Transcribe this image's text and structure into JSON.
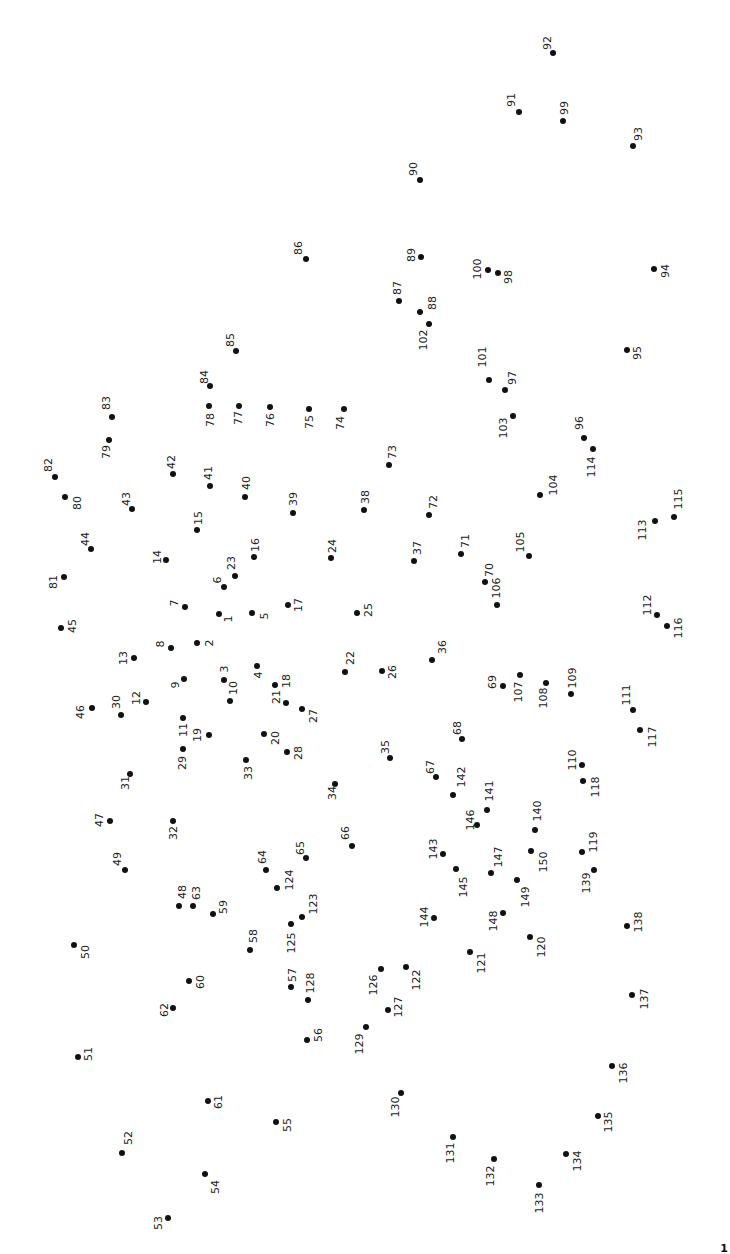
{
  "puzzle": {
    "type": "connect-the-dots",
    "label_rotation_deg": -90,
    "dot_color": "#111111",
    "label_color": "#222222",
    "background": "#ffffff",
    "dot_count": 150,
    "dots": [
      [
        1,
        219,
        614,
        9,
        5
      ],
      [
        2,
        197,
        643,
        12,
        0
      ],
      [
        3,
        224,
        680,
        0,
        -11
      ],
      [
        4,
        257,
        666,
        1,
        9
      ],
      [
        5,
        252,
        613,
        12,
        3
      ],
      [
        6,
        224,
        587,
        -7,
        -7
      ],
      [
        7,
        185,
        607,
        -11,
        -4
      ],
      [
        8,
        171,
        648,
        -11,
        -4
      ],
      [
        9,
        184,
        679,
        -9,
        6
      ],
      [
        10,
        230,
        701,
        3,
        -13
      ],
      [
        11,
        183,
        718,
        0,
        12
      ],
      [
        12,
        146,
        702,
        -10,
        -4
      ],
      [
        13,
        134,
        658,
        -11,
        0
      ],
      [
        14,
        166,
        560,
        -9,
        -3
      ],
      [
        15,
        197,
        530,
        1,
        -12
      ],
      [
        16,
        254,
        557,
        1,
        -12
      ],
      [
        17,
        288,
        605,
        10,
        0
      ],
      [
        18,
        275,
        685,
        11,
        -4
      ],
      [
        19,
        209,
        735,
        -12,
        0
      ],
      [
        20,
        264,
        734,
        11,
        4
      ],
      [
        21,
        286,
        703,
        -10,
        -6
      ],
      [
        22,
        345,
        672,
        5,
        -14
      ],
      [
        23,
        235,
        576,
        -4,
        -13
      ],
      [
        24,
        331,
        558,
        1,
        -12
      ],
      [
        25,
        357,
        613,
        11,
        -3
      ],
      [
        26,
        382,
        671,
        10,
        1
      ],
      [
        27,
        302,
        709,
        11,
        7
      ],
      [
        28,
        287,
        752,
        11,
        1
      ],
      [
        29,
        183,
        749,
        -1,
        14
      ],
      [
        30,
        121,
        715,
        -5,
        -13
      ],
      [
        31,
        130,
        774,
        -5,
        9
      ],
      [
        32,
        173,
        821,
        0,
        12
      ],
      [
        33,
        246,
        760,
        2,
        13
      ],
      [
        34,
        335,
        784,
        -3,
        9
      ],
      [
        35,
        390,
        758,
        -5,
        -11
      ],
      [
        36,
        432,
        660,
        10,
        -13
      ],
      [
        37,
        414,
        561,
        3,
        -13
      ],
      [
        38,
        364,
        510,
        1,
        -13
      ],
      [
        39,
        293,
        513,
        0,
        -14
      ],
      [
        40,
        245,
        497,
        1,
        -14
      ],
      [
        41,
        210,
        486,
        -2,
        -13
      ],
      [
        42,
        173,
        474,
        -2,
        -12
      ],
      [
        43,
        132,
        509,
        -6,
        -10
      ],
      [
        44,
        91,
        549,
        -6,
        -10
      ],
      [
        45,
        61,
        628,
        11,
        -2
      ],
      [
        46,
        92,
        708,
        -12,
        4
      ],
      [
        47,
        110,
        821,
        -11,
        -1
      ],
      [
        48,
        179,
        906,
        3,
        -14
      ],
      [
        49,
        125,
        870,
        -8,
        -11
      ],
      [
        50,
        74,
        945,
        11,
        7
      ],
      [
        51,
        78,
        1057,
        10,
        -3
      ],
      [
        52,
        122,
        1153,
        6,
        -15
      ],
      [
        53,
        168,
        1218,
        -10,
        5
      ],
      [
        54,
        205,
        1174,
        10,
        13
      ],
      [
        55,
        276,
        1122,
        11,
        3
      ],
      [
        56,
        307,
        1040,
        11,
        -5
      ],
      [
        57,
        291,
        987,
        1,
        -12
      ],
      [
        58,
        250,
        950,
        3,
        -14
      ],
      [
        59,
        213,
        914,
        10,
        -7
      ],
      [
        60,
        189,
        981,
        11,
        1
      ],
      [
        61,
        208,
        1101,
        10,
        1
      ],
      [
        62,
        173,
        1008,
        -9,
        2
      ],
      [
        63,
        193,
        906,
        3,
        -13
      ],
      [
        64,
        266,
        870,
        -4,
        -13
      ],
      [
        65,
        306,
        858,
        -6,
        -10
      ],
      [
        66,
        352,
        846,
        -7,
        -13
      ],
      [
        67,
        436,
        777,
        -6,
        -10
      ],
      [
        68,
        462,
        739,
        -5,
        -11
      ],
      [
        69,
        503,
        686,
        -11,
        -4
      ],
      [
        70,
        485,
        582,
        4,
        -12
      ],
      [
        71,
        461,
        554,
        4,
        -13
      ],
      [
        72,
        429,
        515,
        4,
        -13
      ],
      [
        73,
        389,
        465,
        3,
        -13
      ],
      [
        74,
        344,
        409,
        -4,
        14
      ],
      [
        75,
        309,
        409,
        0,
        13
      ],
      [
        76,
        270,
        407,
        0,
        13
      ],
      [
        77,
        239,
        406,
        -1,
        12
      ],
      [
        78,
        209,
        406,
        1,
        14
      ],
      [
        79,
        109,
        440,
        -3,
        12
      ],
      [
        80,
        65,
        497,
        12,
        6
      ],
      [
        81,
        64,
        577,
        -11,
        5
      ],
      [
        82,
        55,
        477,
        -7,
        -12
      ],
      [
        83,
        112,
        417,
        -6,
        -14
      ],
      [
        84,
        210,
        386,
        -6,
        -9
      ],
      [
        85,
        236,
        351,
        -6,
        -11
      ],
      [
        86,
        306,
        259,
        -8,
        -11
      ],
      [
        87,
        399,
        301,
        -2,
        -13
      ],
      [
        88,
        420,
        312,
        12,
        -9
      ],
      [
        89,
        421,
        257,
        -10,
        -2
      ],
      [
        90,
        420,
        180,
        -7,
        -11
      ],
      [
        91,
        519,
        112,
        -8,
        -12
      ],
      [
        92,
        553,
        53,
        -6,
        -10
      ],
      [
        93,
        633,
        146,
        5,
        -12
      ],
      [
        94,
        654,
        269,
        11,
        2
      ],
      [
        95,
        627,
        350,
        10,
        3
      ],
      [
        96,
        584,
        438,
        -5,
        -15
      ],
      [
        97,
        505,
        390,
        7,
        -12
      ],
      [
        98,
        498,
        273,
        10,
        4
      ],
      [
        99,
        563,
        121,
        1,
        -13
      ],
      [
        100,
        488,
        270,
        -11,
        -1
      ],
      [
        101,
        489,
        380,
        -7,
        -23
      ],
      [
        102,
        429,
        324,
        -6,
        16
      ],
      [
        103,
        513,
        416,
        -10,
        12
      ],
      [
        104,
        540,
        495,
        13,
        -10
      ],
      [
        105,
        529,
        556,
        -9,
        -14
      ],
      [
        106,
        497,
        605,
        -1,
        -17
      ],
      [
        107,
        520,
        675,
        -2,
        17
      ],
      [
        108,
        546,
        683,
        -3,
        15
      ],
      [
        109,
        571,
        694,
        1,
        -16
      ],
      [
        110,
        582,
        765,
        -10,
        -5
      ],
      [
        111,
        633,
        710,
        -7,
        -15
      ],
      [
        112,
        657,
        615,
        -10,
        -10
      ],
      [
        113,
        655,
        521,
        -13,
        9
      ],
      [
        114,
        593,
        449,
        -2,
        18
      ],
      [
        115,
        674,
        517,
        4,
        -18
      ],
      [
        116,
        667,
        626,
        11,
        2
      ],
      [
        117,
        640,
        730,
        12,
        7
      ],
      [
        118,
        583,
        781,
        12,
        6
      ],
      [
        119,
        582,
        852,
        11,
        -10
      ],
      [
        120,
        530,
        937,
        11,
        10
      ],
      [
        121,
        470,
        952,
        11,
        11
      ],
      [
        122,
        406,
        967,
        10,
        13
      ],
      [
        123,
        302,
        917,
        11,
        -13
      ],
      [
        124,
        277,
        888,
        12,
        -8
      ],
      [
        125,
        291,
        924,
        0,
        19
      ],
      [
        126,
        381,
        969,
        -8,
        16
      ],
      [
        127,
        388,
        1010,
        10,
        -3
      ],
      [
        128,
        308,
        1000,
        2,
        -17
      ],
      [
        129,
        366,
        1027,
        -7,
        17
      ],
      [
        130,
        401,
        1093,
        -6,
        14
      ],
      [
        131,
        453,
        1137,
        -3,
        16
      ],
      [
        132,
        494,
        1159,
        -4,
        17
      ],
      [
        133,
        539,
        1185,
        0,
        18
      ],
      [
        134,
        566,
        1154,
        11,
        7
      ],
      [
        135,
        598,
        1116,
        10,
        6
      ],
      [
        136,
        612,
        1066,
        11,
        7
      ],
      [
        137,
        632,
        995,
        12,
        4
      ],
      [
        138,
        627,
        926,
        11,
        -4
      ],
      [
        139,
        594,
        870,
        -8,
        13
      ],
      [
        140,
        535,
        830,
        2,
        -19
      ],
      [
        141,
        487,
        810,
        2,
        -19
      ],
      [
        142,
        453,
        795,
        8,
        -18
      ],
      [
        143,
        443,
        854,
        -10,
        -5
      ],
      [
        144,
        434,
        918,
        -10,
        -1
      ],
      [
        145,
        456,
        869,
        7,
        18
      ],
      [
        146,
        477,
        825,
        -7,
        -5
      ],
      [
        147,
        491,
        873,
        7,
        -16
      ],
      [
        148,
        503,
        913,
        -10,
        8
      ],
      [
        149,
        517,
        880,
        8,
        17
      ],
      [
        150,
        531,
        851,
        12,
        11
      ]
    ]
  },
  "corner_mark": {
    "text": "1"
  }
}
